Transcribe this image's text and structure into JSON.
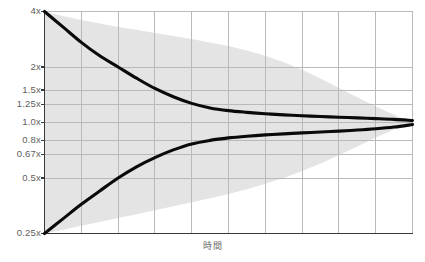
{
  "chart_data": {
    "type": "line",
    "title": "",
    "subtitle": "",
    "xlabel": "時間",
    "ylabel": "",
    "yscale": "log",
    "ylim": [
      0.25,
      4
    ],
    "xlim": [
      0,
      10
    ],
    "grid": true,
    "legend_position": "none",
    "ytick_labels": [
      "4x",
      "2x",
      "1.5x",
      "1.25x",
      "1.0x",
      "0.8x",
      "0.67x",
      "0.5x",
      "0.25x"
    ],
    "ytick_values": [
      4,
      2,
      1.5,
      1.25,
      1.0,
      0.8,
      0.67,
      0.5,
      0.25
    ],
    "xtick_labels": [],
    "xtick_count": 10,
    "x": [
      0,
      0.5,
      1,
      1.5,
      2,
      2.5,
      3,
      3.5,
      4,
      4.5,
      5,
      5.5,
      6,
      6.5,
      7,
      7.5,
      8,
      8.5,
      9,
      9.5,
      10
    ],
    "series": [
      {
        "name": "upper-bound",
        "color": "#0a0a0a",
        "values": [
          4.0,
          3.3,
          2.72,
          2.3,
          2.0,
          1.74,
          1.53,
          1.38,
          1.27,
          1.2,
          1.16,
          1.135,
          1.115,
          1.1,
          1.088,
          1.077,
          1.068,
          1.059,
          1.05,
          1.04,
          1.025
        ]
      },
      {
        "name": "lower-bound",
        "color": "#0a0a0a",
        "values": [
          0.25,
          0.3,
          0.36,
          0.425,
          0.5,
          0.575,
          0.645,
          0.71,
          0.765,
          0.8,
          0.825,
          0.843,
          0.857,
          0.868,
          0.878,
          0.888,
          0.898,
          0.91,
          0.925,
          0.945,
          0.975
        ]
      }
    ],
    "band": {
      "name": "uncertainty-band",
      "color": "#e4e4e4",
      "upper": [
        4.0,
        3.78,
        3.6,
        3.44,
        3.3,
        3.18,
        3.06,
        2.95,
        2.84,
        2.72,
        2.6,
        2.46,
        2.3,
        2.12,
        1.93,
        1.73,
        1.54,
        1.37,
        1.22,
        1.1,
        1.0
      ],
      "lower": [
        0.25,
        0.262,
        0.275,
        0.289,
        0.303,
        0.318,
        0.334,
        0.351,
        0.369,
        0.388,
        0.41,
        0.435,
        0.465,
        0.5,
        0.545,
        0.6,
        0.665,
        0.74,
        0.83,
        0.915,
        1.0
      ]
    },
    "axis_color": "#3a3a3a",
    "grid_color": "#b9b9b9",
    "background": "#ffffff",
    "tick_label_color": "#5e5e5e"
  }
}
